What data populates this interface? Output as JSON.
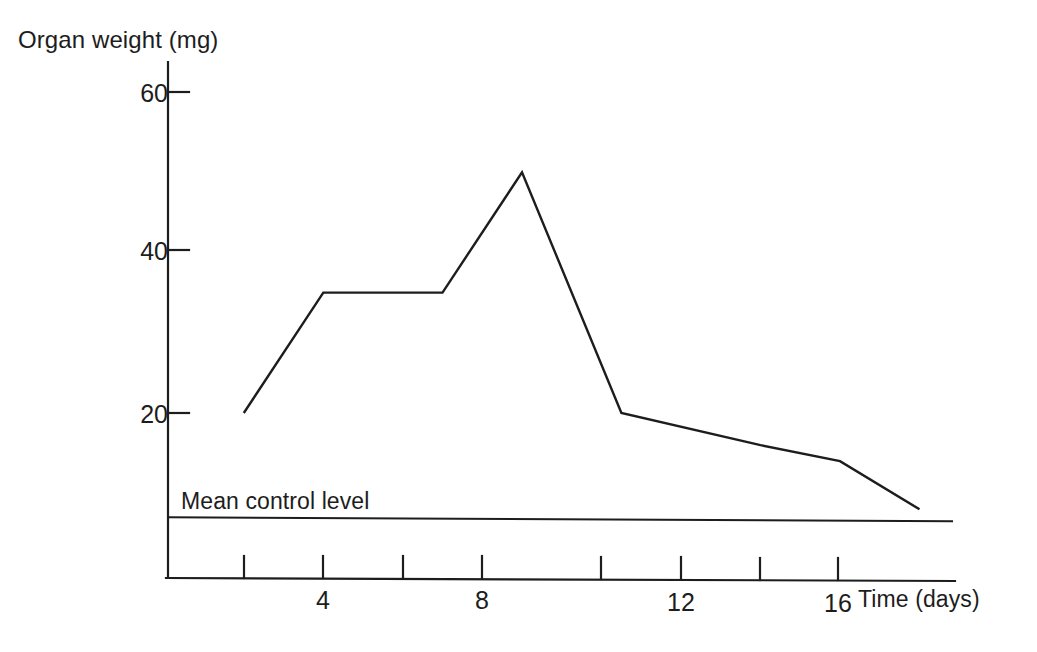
{
  "figure": {
    "background_color": "#ffffff",
    "ink_color": "#1d1d1d"
  },
  "axes": {
    "y_axis_title": "Organ weight (mg)",
    "x_axis_title": "Time (days)",
    "y_ticks": [
      {
        "value": 60,
        "label": "60"
      },
      {
        "value": 40,
        "label": "40"
      },
      {
        "value": 20,
        "label": "20"
      }
    ],
    "x_ticks": [
      {
        "value": 2,
        "label": ""
      },
      {
        "value": 4,
        "label": "4"
      },
      {
        "value": 6,
        "label": ""
      },
      {
        "value": 8,
        "label": "8"
      },
      {
        "value": 10,
        "label": ""
      },
      {
        "value": 12,
        "label": "12"
      },
      {
        "value": 14,
        "label": ""
      },
      {
        "value": 16,
        "label": "16"
      }
    ]
  },
  "annotations": {
    "control_line_label": "Mean control level",
    "control_line_value": 7
  },
  "chart_data": {
    "type": "line",
    "title": "",
    "subtitle": "",
    "xlabel": "Time (days)",
    "ylabel": "Organ weight (mg)",
    "xlim": [
      0,
      20
    ],
    "ylim": [
      0,
      65
    ],
    "grid": false,
    "legend": "none",
    "x_tick_values": [
      2,
      4,
      6,
      8,
      10,
      12,
      14,
      16
    ],
    "x_tick_labels": [
      "",
      "4",
      "",
      "8",
      "",
      "12",
      "",
      "16"
    ],
    "y_tick_values": [
      20,
      40,
      60
    ],
    "y_tick_labels": [
      "20",
      "40",
      "60"
    ],
    "series": [
      {
        "name": "Organ weight",
        "x": [
          1.0,
          3.0,
          6.0,
          8.0,
          10.5,
          14.0,
          16.0,
          18.0
        ],
        "values": [
          20,
          35,
          35,
          50,
          20,
          16,
          14,
          8
        ]
      }
    ],
    "reference_lines": [
      {
        "name": "Mean control level",
        "orientation": "horizontal",
        "value": 7,
        "label": "Mean control level"
      }
    ]
  }
}
